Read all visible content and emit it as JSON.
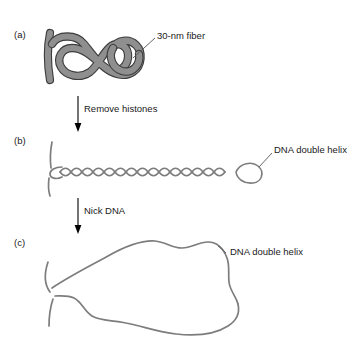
{
  "figure": {
    "background_color": "#ffffff",
    "fiber_color": "#8a8a8a",
    "fiber_outline_color": "#3c3c3c",
    "dna_color": "#7d7d7d",
    "arrow_color": "#000000",
    "text_color": "#1a1a1a",
    "leader_color": "#555555"
  },
  "panels": [
    {
      "letter": "(a)",
      "name": "panel-a-30nm-fiber",
      "callout": "30-nm fiber"
    },
    {
      "letter": "(b)",
      "name": "panel-b-supercoiled-dna",
      "callout": "DNA double helix"
    },
    {
      "letter": "(c)",
      "name": "panel-c-relaxed-dna",
      "callout": "DNA double helix"
    }
  ],
  "steps": [
    {
      "label": "Remove histones",
      "name": "step-remove-histones"
    },
    {
      "label": "Nick DNA",
      "name": "step-nick-dna"
    }
  ]
}
